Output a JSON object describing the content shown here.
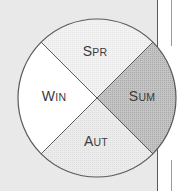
{
  "diagram": {
    "type": "season-wheel",
    "center": [
      97,
      98
    ],
    "radius": 79,
    "segments": [
      {
        "key": "spring",
        "label_cap": "S",
        "label_rest": "PR",
        "label": "SPR",
        "fill": "#efefef",
        "position": "top"
      },
      {
        "key": "summer",
        "label_cap": "S",
        "label_rest": "UM",
        "label": "SUM",
        "fill": "#bdbdbd",
        "position": "right"
      },
      {
        "key": "autumn",
        "label_cap": "A",
        "label_rest": "UT",
        "label": "AUT",
        "fill": "#e6e6e6",
        "position": "bottom"
      },
      {
        "key": "winter",
        "label_cap": "W",
        "label_rest": "IN",
        "label": "WIN",
        "fill": "#ffffff",
        "position": "left"
      }
    ]
  },
  "colors": {
    "page_background": "#e9e9e9",
    "outline": "#5a5a5a",
    "text": "#3a3a3a"
  }
}
